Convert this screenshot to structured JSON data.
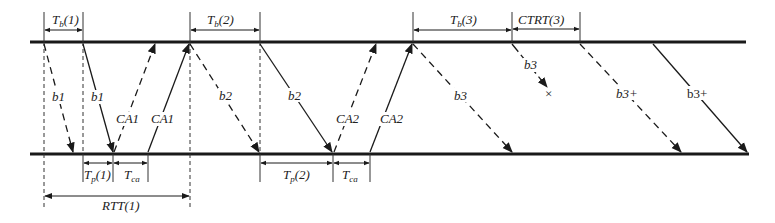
{
  "diagram": {
    "type": "timing-sequence",
    "lines": {
      "top_y": 42,
      "bottom_y": 154
    },
    "labels": {
      "tb1": "T",
      "tb1_sub": "b",
      "tb1_arg": "(1)",
      "tb2": "T",
      "tb2_sub": "b",
      "tb2_arg": "(2)",
      "tb3": "T",
      "tb3_sub": "b",
      "tb3_arg": "(3)",
      "ctrt3": "CTRT(3)",
      "tp1": "T",
      "tp1_sub": "p",
      "tp1_arg": "(1)",
      "tca1": "T",
      "tca1_sub": "ca",
      "tp2": "T",
      "tp2_sub": "p",
      "tp2_arg": "(2)",
      "tca2": "T",
      "tca2_sub": "ca",
      "rtt1": "RTT(1)",
      "b1_dashed": "b1",
      "b1_solid": "b1",
      "ca1_dashed": "CA1",
      "ca1_solid": "CA1",
      "b2_dashed": "b2",
      "b2_solid": "b2",
      "ca2_dashed": "CA2",
      "ca2_solid": "CA2",
      "b3_dashed": "b3",
      "b3_lost": "b3",
      "lost_mark": "×",
      "b3plus_dashed": "b3+",
      "b3plus_solid": "b3+"
    },
    "color": "#1a1a1a"
  }
}
